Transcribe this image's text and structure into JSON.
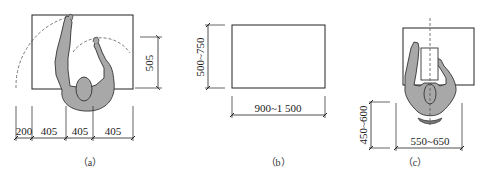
{
  "panels": {
    "a": {
      "caption": "（a）",
      "dim_vertical": "505",
      "dims_horizontal": [
        "200",
        "405",
        "405",
        "405"
      ]
    },
    "b": {
      "caption": "（b）",
      "dim_vertical": "500~750",
      "dim_horizontal": "900~1 500"
    },
    "c": {
      "caption": "（c）",
      "dim_vertical": "450~600",
      "dim_horizontal": "550~650"
    }
  },
  "colors": {
    "line": "#222222",
    "figure_fill": "#a8a8a8",
    "background": "#ffffff"
  }
}
